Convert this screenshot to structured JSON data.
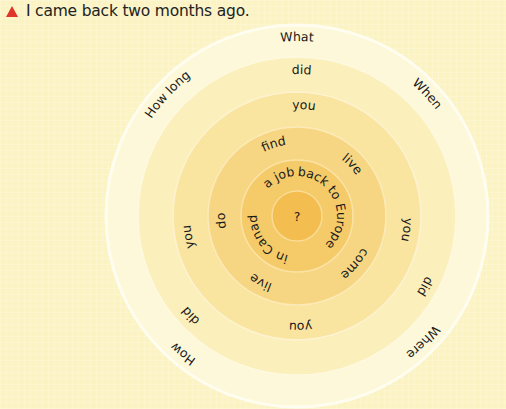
{
  "caption": {
    "bullet_icon": "red-triangle-icon",
    "text": "I came back two months ago."
  },
  "wheel": {
    "center_label": "?",
    "rings": [
      {
        "name": "ring-1-outer",
        "words": [
          "What",
          "When",
          "Where",
          "How",
          "How long"
        ]
      },
      {
        "name": "ring-2",
        "words": [
          "did",
          "did",
          "did"
        ]
      },
      {
        "name": "ring-3",
        "words": [
          "you",
          "you",
          "you",
          "you"
        ]
      },
      {
        "name": "ring-4",
        "words": [
          "find",
          "live",
          "come",
          "live",
          "do"
        ]
      },
      {
        "name": "ring-5-inner",
        "words": [
          "a job",
          "back to Europe",
          "in Canada"
        ]
      }
    ],
    "colors": {
      "background": "#fbf3c2",
      "ring1": "#fdf9dc",
      "ring2": "#fbeeb6",
      "ring3": "#f9e39c",
      "ring4": "#f7d57e",
      "ring5": "#f5c862",
      "center": "#f3ba4a",
      "accent": "#e0352b"
    }
  }
}
